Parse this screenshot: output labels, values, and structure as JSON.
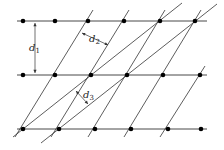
{
  "diagram": {
    "colors": {
      "line": "#333333",
      "dot": "#000000",
      "background": "#ffffff"
    },
    "rows": [
      {
        "y": 21,
        "x_start": 17,
        "x_end": 207,
        "points": [
          23,
          55,
          88,
          124,
          160,
          195
        ]
      },
      {
        "y": 75,
        "x_start": 17,
        "x_end": 207,
        "points": [
          23,
          55,
          91,
          127,
          163,
          200
        ]
      },
      {
        "y": 129,
        "x_start": 17,
        "x_end": 207,
        "points": [
          23,
          59,
          95,
          131,
          168,
          201
        ]
      }
    ],
    "steep_lines": [
      {
        "x1": 15,
        "y1": 137,
        "x2": 93,
        "y2": 10
      },
      {
        "x1": 51,
        "y1": 137,
        "x2": 129,
        "y2": 10
      },
      {
        "x1": 88,
        "y1": 137,
        "x2": 165,
        "y2": 10
      },
      {
        "x1": 124,
        "y1": 137,
        "x2": 201,
        "y2": 10
      },
      {
        "x1": 160,
        "y1": 137,
        "x2": 205,
        "y2": 66
      }
    ],
    "shallow_lines": [
      {
        "x1": 13,
        "y1": 137,
        "x2": 182,
        "y2": 3
      },
      {
        "x1": 41,
        "y1": 143,
        "x2": 217,
        "y2": 4
      }
    ],
    "labels": {
      "d1": {
        "base": "d",
        "sub": "1",
        "x": 29,
        "y": 51
      },
      "d2": {
        "base": "d",
        "sub": "2",
        "x": 89,
        "y": 42
      },
      "d3": {
        "base": "d",
        "sub": "3",
        "x": 83,
        "y": 98
      }
    },
    "dimension_markers": {
      "d1": {
        "x1": 35,
        "y1": 23,
        "x2": 35,
        "y2": 73
      },
      "d2": {
        "x1": 82,
        "y1": 33,
        "x2": 108,
        "y2": 45
      },
      "d3": {
        "x1": 76,
        "y1": 91,
        "x2": 88,
        "y2": 104
      }
    }
  }
}
